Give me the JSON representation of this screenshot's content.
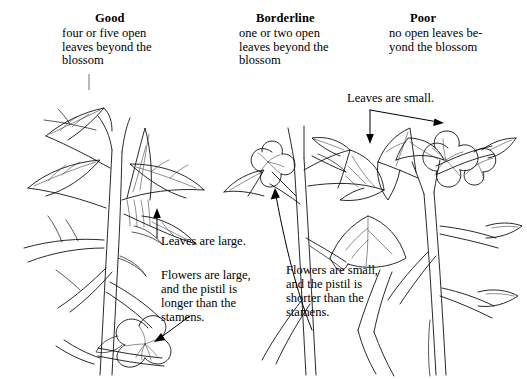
{
  "figure": {
    "background_color": "#ffffff",
    "ink_color": "#111111",
    "columns": [
      {
        "id": "good",
        "heading": "Good",
        "description": "four or five open\nleaves beyond the\nblossom"
      },
      {
        "id": "borderline",
        "heading": "Borderline",
        "description": "one or two open\nleaves beyond the\nblossom"
      },
      {
        "id": "poor",
        "heading": "Poor",
        "description": "no open leaves be-\nyond the blossom"
      }
    ],
    "annotations": [
      {
        "id": "leaves-large",
        "text": "Leaves are large.",
        "column": "good"
      },
      {
        "id": "flowers-large",
        "text": "Flowers are large,\nand the pistil is\nlonger than the\nstamens.",
        "column": "good"
      },
      {
        "id": "leaves-small",
        "text": "Leaves are small.",
        "column": "borderline"
      },
      {
        "id": "flowers-small",
        "text": "Flowers are small,\nand the pistil is\nshorter than the\nstamens.",
        "column": "borderline"
      }
    ],
    "illustrations": [
      {
        "id": "plant-good",
        "caption_ref": "good",
        "subject": "plant-branch-drawing"
      },
      {
        "id": "plant-borderline",
        "caption_ref": "borderline",
        "subject": "plant-branch-drawing"
      },
      {
        "id": "plant-poor",
        "caption_ref": "poor",
        "subject": "plant-branch-drawing"
      }
    ]
  }
}
